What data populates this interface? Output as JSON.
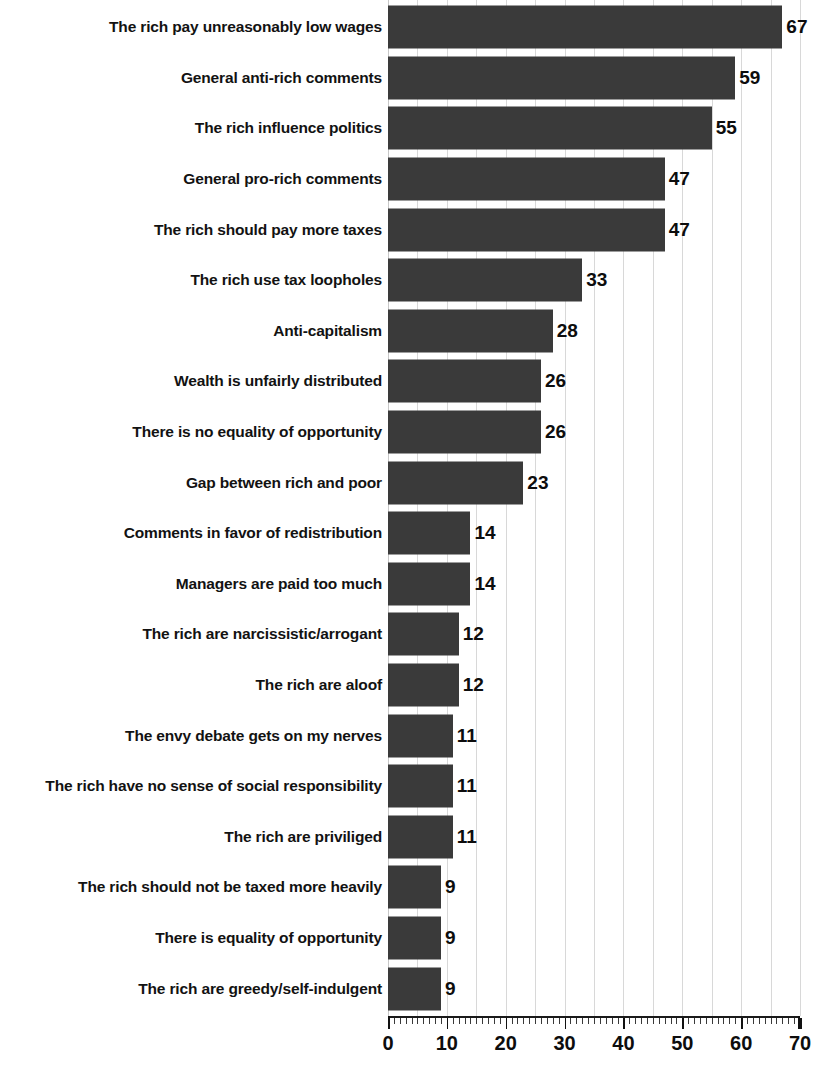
{
  "chart_data": {
    "type": "bar",
    "orientation": "horizontal",
    "title": "",
    "xlabel": "",
    "ylabel": "",
    "xlim": [
      0,
      70
    ],
    "grid": true,
    "gridlines_every": 5,
    "legend": "none",
    "tick_labels": [
      "0",
      "10",
      "20",
      "30",
      "40",
      "50",
      "60",
      "70"
    ],
    "tick_values": [
      0,
      10,
      20,
      30,
      40,
      50,
      60,
      70
    ],
    "minor_tick_interval": 1,
    "bar_color": "#3a3a3a",
    "categories": [
      "The rich pay unreasonably low wages",
      "General anti-rich comments",
      "The rich influence politics",
      "General pro-rich comments",
      "The rich should pay more taxes",
      "The rich use tax loopholes",
      "Anti-capitalism",
      "Wealth is unfairly distributed",
      "There is no equality of opportunity",
      "Gap between rich and poor",
      "Comments in favor of redistribution",
      "Managers are paid too much",
      "The rich are narcissistic/arrogant",
      "The rich are aloof",
      "The envy debate gets on my nerves",
      "The rich have no sense of social responsibility",
      "The rich are priviliged",
      "The rich should not be taxed more heavily",
      "There is equality of opportunity",
      "The rich are greedy/self-indulgent"
    ],
    "values": [
      67,
      59,
      55,
      47,
      47,
      33,
      28,
      26,
      26,
      23,
      14,
      14,
      12,
      12,
      11,
      11,
      11,
      9,
      9,
      9
    ],
    "value_labels": [
      "67",
      "59",
      "55",
      "47",
      "47",
      "33",
      "28",
      "26",
      "26",
      "23",
      "14",
      "14",
      "12",
      "12",
      "11",
      "11",
      "11",
      "9",
      "9",
      "9"
    ]
  },
  "footer": {
    "caption": ""
  }
}
